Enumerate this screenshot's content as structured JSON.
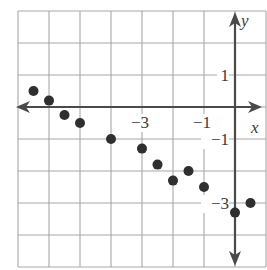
{
  "chart_data": {
    "type": "scatter",
    "title": "",
    "xlabel": "x",
    "ylabel": "y",
    "xlim": [
      -7,
      1
    ],
    "ylim": [
      -5,
      3
    ],
    "grid": true,
    "grid_step": 1,
    "x_tick_labels": [
      {
        "value": -3,
        "label": "−3"
      },
      {
        "value": -1,
        "label": "−1"
      }
    ],
    "y_tick_labels": [
      {
        "value": 1,
        "label": "1"
      },
      {
        "value": -1,
        "label": "−1"
      },
      {
        "value": -3,
        "label": "−3"
      }
    ],
    "points": [
      {
        "x": -6.5,
        "y": 0.5
      },
      {
        "x": -6.0,
        "y": 0.2
      },
      {
        "x": -5.5,
        "y": -0.25
      },
      {
        "x": -5.0,
        "y": -0.5
      },
      {
        "x": -4.0,
        "y": -1.0
      },
      {
        "x": -3.0,
        "y": -1.3
      },
      {
        "x": -2.5,
        "y": -1.8
      },
      {
        "x": -2.0,
        "y": -2.3
      },
      {
        "x": -1.5,
        "y": -2.0
      },
      {
        "x": -1.0,
        "y": -2.5
      },
      {
        "x": 0.0,
        "y": -3.3
      },
      {
        "x": 0.5,
        "y": -3.0
      }
    ],
    "colors": {
      "grid": "#a8a8a8",
      "axis": "#4a4a4a",
      "points": "#2f2f2f"
    }
  }
}
